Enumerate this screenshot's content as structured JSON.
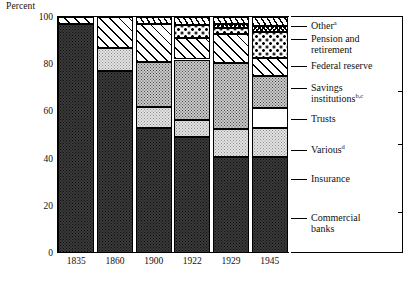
{
  "chart_data": {
    "type": "bar",
    "stacked": true,
    "title": "",
    "xlabel": "",
    "ylabel": "Percent",
    "ylim": [
      0,
      100
    ],
    "yticks": [
      0,
      20,
      40,
      60,
      80,
      100
    ],
    "grid": false,
    "legend_position": "right",
    "categories": [
      "1835",
      "1860",
      "1900",
      "1922",
      "1929",
      "1945"
    ],
    "series": [
      {
        "name": "Commercial banks",
        "pattern": "dark-speckle",
        "values": [
          97.0,
          77.0,
          53.0,
          49.0,
          40.5,
          40.5
        ]
      },
      {
        "name": "Insurance",
        "pattern": "light-checker",
        "values": [
          0,
          10.0,
          9.0,
          7.5,
          12.0,
          12.5
        ]
      },
      {
        "name": "Various",
        "pattern": "blank-white",
        "values": [
          0,
          0,
          0,
          0,
          0,
          8.5
        ]
      },
      {
        "name": "Trusts",
        "pattern": "medium-checker",
        "values": [
          0,
          0,
          19.0,
          25.5,
          28.0,
          13.5
        ]
      },
      {
        "name": "Savings institutions",
        "pattern": "wide-diagonal",
        "values": [
          3.0,
          13.0,
          16.0,
          9.0,
          12.5,
          7.5
        ]
      },
      {
        "name": "Federal reserve",
        "pattern": "sparse-dots",
        "values": [
          0,
          0,
          0,
          5.5,
          2.5,
          11.0
        ]
      },
      {
        "name": "Pension and retirement",
        "pattern": "dense-crosshatch",
        "values": [
          0,
          0,
          0,
          0,
          1.5,
          2.5
        ]
      },
      {
        "name": "Other",
        "pattern": "steep-hatch",
        "values": [
          0,
          0,
          3.0,
          3.5,
          3.0,
          4.0
        ]
      }
    ],
    "legend_entries": [
      {
        "label": "Other",
        "superscript": "a"
      },
      {
        "label": "Pension and\nretirement",
        "superscript": ""
      },
      {
        "label": "Federal reserve",
        "superscript": ""
      },
      {
        "label": "Savings\ninstitutions",
        "superscript": "b,c"
      },
      {
        "label": "Trusts",
        "superscript": ""
      },
      {
        "label": "Various",
        "superscript": "d"
      },
      {
        "label": "Insurance",
        "superscript": ""
      },
      {
        "label": "Commercial\nbanks",
        "superscript": ""
      }
    ]
  }
}
